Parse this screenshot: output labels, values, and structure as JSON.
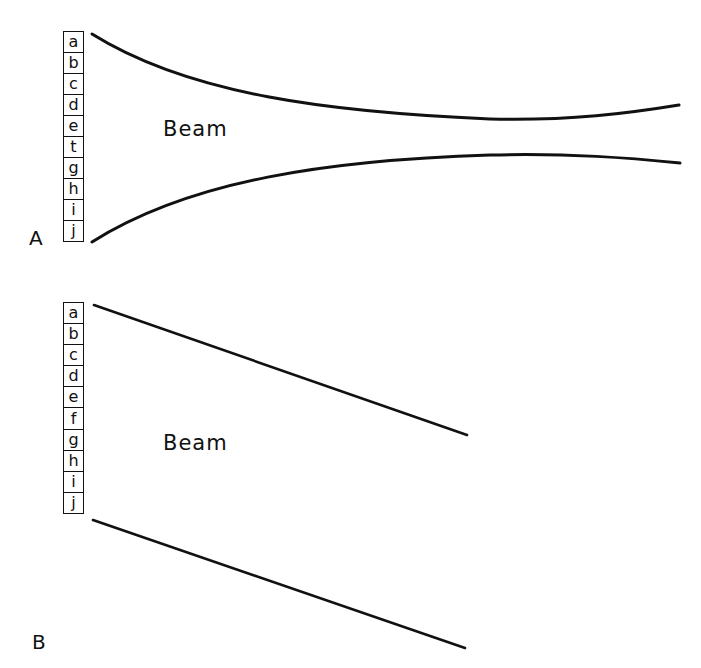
{
  "figure": {
    "panels": [
      {
        "id": "A",
        "label": "A",
        "beam_label": "Beam",
        "detector_cells": [
          "a",
          "b",
          "c",
          "d",
          "e",
          "t",
          "g",
          "h",
          "i",
          "j"
        ],
        "beam_shape": "converging-diverging (waist)"
      },
      {
        "id": "B",
        "label": "B",
        "beam_label": "Beam",
        "detector_cells": [
          "a",
          "b",
          "c",
          "d",
          "e",
          "f",
          "g",
          "h",
          "i",
          "j"
        ],
        "beam_shape": "parallel, angled downward"
      }
    ]
  },
  "colors": {
    "line": "#111111",
    "background": "#ffffff"
  }
}
